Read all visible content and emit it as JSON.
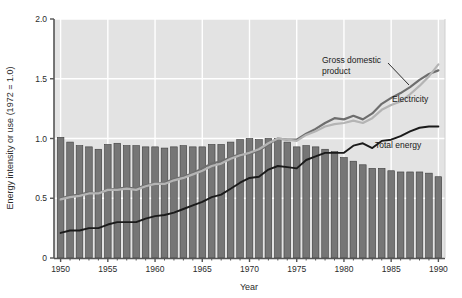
{
  "chart_data": {
    "type": "bar",
    "title": "",
    "xlabel": "Year",
    "ylabel": "Energy intensity or use (1972 = 1.0)",
    "xlim": [
      1949.3,
      1990.7
    ],
    "ylim": [
      0,
      2.0
    ],
    "grid": true,
    "legend_position": "inline-annotations",
    "y_ticks": [
      "0",
      "0.5",
      "1.0",
      "1.5",
      "2.0"
    ],
    "y_tick_values": [
      0,
      0.5,
      1.0,
      1.5,
      2.0
    ],
    "x_ticks": [
      "1950",
      "1955",
      "1960",
      "1965",
      "1970",
      "1975",
      "1980",
      "1985",
      "1990"
    ],
    "x_tick_values": [
      1950,
      1955,
      1960,
      1965,
      1970,
      1975,
      1980,
      1985,
      1990
    ],
    "x": [
      1950,
      1951,
      1952,
      1953,
      1954,
      1955,
      1956,
      1957,
      1958,
      1959,
      1960,
      1961,
      1962,
      1963,
      1964,
      1965,
      1966,
      1967,
      1968,
      1969,
      1970,
      1971,
      1972,
      1973,
      1974,
      1975,
      1976,
      1977,
      1978,
      1979,
      1980,
      1981,
      1982,
      1983,
      1984,
      1985,
      1986,
      1987,
      1988,
      1989,
      1990
    ],
    "bars": {
      "name": "Energy intensity",
      "color": "#767676",
      "edge_color": "#3c3c3c",
      "values": [
        1.01,
        0.97,
        0.94,
        0.93,
        0.91,
        0.95,
        0.96,
        0.94,
        0.94,
        0.93,
        0.93,
        0.92,
        0.93,
        0.94,
        0.93,
        0.93,
        0.95,
        0.95,
        0.97,
        0.99,
        1.0,
        0.99,
        1.0,
        1.0,
        0.97,
        0.93,
        0.94,
        0.93,
        0.91,
        0.89,
        0.84,
        0.81,
        0.78,
        0.75,
        0.75,
        0.73,
        0.72,
        0.72,
        0.72,
        0.71,
        0.68
      ]
    },
    "series": [
      {
        "name": "Gross domestic product",
        "color": "#6e6e6e",
        "values": [
          0.5,
          0.52,
          0.53,
          0.55,
          0.54,
          0.57,
          0.58,
          0.59,
          0.58,
          0.61,
          0.62,
          0.63,
          0.66,
          0.68,
          0.71,
          0.75,
          0.79,
          0.81,
          0.84,
          0.87,
          0.87,
          0.9,
          0.95,
          1.0,
          0.99,
          0.99,
          1.04,
          1.08,
          1.13,
          1.17,
          1.16,
          1.19,
          1.16,
          1.21,
          1.29,
          1.34,
          1.38,
          1.43,
          1.49,
          1.54,
          1.57
        ]
      },
      {
        "name": "Electricity",
        "color": "#b4b4b4",
        "values": [
          0.49,
          0.51,
          0.52,
          0.54,
          0.54,
          0.57,
          0.57,
          0.58,
          0.57,
          0.6,
          0.62,
          0.62,
          0.65,
          0.67,
          0.7,
          0.73,
          0.77,
          0.79,
          0.83,
          0.86,
          0.88,
          0.91,
          0.96,
          1.0,
          0.99,
          0.98,
          1.03,
          1.06,
          1.1,
          1.12,
          1.13,
          1.15,
          1.13,
          1.17,
          1.24,
          1.28,
          1.31,
          1.37,
          1.44,
          1.52,
          1.62
        ]
      },
      {
        "name": "Total energy",
        "color": "#1a1a1a",
        "values": [
          0.21,
          0.23,
          0.23,
          0.25,
          0.25,
          0.28,
          0.3,
          0.3,
          0.3,
          0.33,
          0.35,
          0.36,
          0.38,
          0.41,
          0.44,
          0.47,
          0.51,
          0.53,
          0.58,
          0.63,
          0.67,
          0.68,
          0.74,
          0.77,
          0.76,
          0.75,
          0.82,
          0.85,
          0.88,
          0.88,
          0.88,
          0.94,
          0.96,
          0.92,
          0.98,
          0.99,
          1.02,
          1.06,
          1.09,
          1.1,
          1.1
        ]
      }
    ],
    "annotations": [
      {
        "id": "gdp",
        "label_line1": "Gross domestic",
        "label_line2": "product",
        "leader": true
      },
      {
        "id": "electricity",
        "label_line1": "Electricity",
        "label_line2": "",
        "leader": false
      },
      {
        "id": "total-energy",
        "label_line1": "Total energy",
        "label_line2": "",
        "leader": false
      }
    ],
    "colors": {
      "plot_background": "#e3e3e3",
      "grid": "#ffffff",
      "axis": "#555555",
      "page_background": "#ffffff"
    }
  }
}
